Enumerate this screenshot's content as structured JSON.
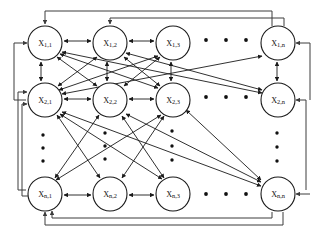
{
  "figure": {
    "kind": "neural-network-graph",
    "background_color": "#ffffff",
    "node_fill_color": "#ffffff",
    "node_stroke_color": "#1a1a1a",
    "edge_color": "#1a1a1a",
    "loop_edge_color": "#3c3c3c",
    "grid": {
      "row_index_labels": [
        "1",
        "2",
        "n"
      ],
      "column_index_labels": [
        "1",
        "2",
        "3",
        "n"
      ]
    },
    "nodes": [
      {
        "id": "x-1-1",
        "base": "X",
        "sub": "1,1",
        "label": "X1,1",
        "row": 1,
        "col": 1,
        "cx": 45,
        "cy": 43,
        "r": 17
      },
      {
        "id": "x-1-2",
        "base": "X",
        "sub": "1,2",
        "label": "X1,2",
        "row": 1,
        "col": 2,
        "cx": 110,
        "cy": 43,
        "r": 17
      },
      {
        "id": "x-1-3",
        "base": "X",
        "sub": "1,3",
        "label": "X1,3",
        "row": 1,
        "col": 3,
        "cx": 173,
        "cy": 43,
        "r": 17
      },
      {
        "id": "x-1-n",
        "base": "X",
        "sub": "1,n",
        "label": "X1,n",
        "row": 1,
        "col": 4,
        "cx": 278,
        "cy": 43,
        "r": 17
      },
      {
        "id": "x-2-1",
        "base": "X",
        "sub": "2,1",
        "label": "X2,1",
        "row": 2,
        "col": 1,
        "cx": 45,
        "cy": 100,
        "r": 17
      },
      {
        "id": "x-2-2",
        "base": "X",
        "sub": "2,2",
        "label": "X2,2",
        "row": 2,
        "col": 2,
        "cx": 110,
        "cy": 100,
        "r": 17
      },
      {
        "id": "x-2-3",
        "base": "X",
        "sub": "2,3",
        "label": "X2,3",
        "row": 2,
        "col": 3,
        "cx": 173,
        "cy": 100,
        "r": 17
      },
      {
        "id": "x-2-n",
        "base": "X",
        "sub": "2,n",
        "label": "X2,n",
        "row": 2,
        "col": 4,
        "cx": 278,
        "cy": 100,
        "r": 17
      },
      {
        "id": "x-n-1",
        "base": "X",
        "sub": "n,1",
        "label": "Xn,1",
        "row": 3,
        "col": 1,
        "cx": 45,
        "cy": 194,
        "r": 17
      },
      {
        "id": "x-n-2",
        "base": "X",
        "sub": "n,2",
        "label": "Xn,2",
        "row": 3,
        "col": 2,
        "cx": 110,
        "cy": 194,
        "r": 17
      },
      {
        "id": "x-n-3",
        "base": "X",
        "sub": "n,3",
        "label": "Xn,3",
        "row": 3,
        "col": 3,
        "cx": 173,
        "cy": 194,
        "r": 17
      },
      {
        "id": "x-n-n",
        "base": "X",
        "sub": "n,n",
        "label": "Xn,n",
        "row": 3,
        "col": 4,
        "cx": 278,
        "cy": 194,
        "r": 17
      }
    ],
    "horizontal_ellipses": [
      {
        "id": "ellipsis-row-1",
        "row": 1,
        "cy": 40,
        "xs": [
          206,
          226,
          246
        ]
      },
      {
        "id": "ellipsis-row-2",
        "row": 2,
        "cy": 97,
        "xs": [
          206,
          226,
          246
        ]
      },
      {
        "id": "ellipsis-row-n",
        "row": 3,
        "cy": 194,
        "xs": [
          206,
          226,
          246
        ]
      }
    ],
    "vertical_ellipses": [
      {
        "id": "ellipsis-col-1",
        "col": 1,
        "cx": 43,
        "ys": [
          135,
          148,
          161
        ]
      },
      {
        "id": "ellipsis-col-2",
        "col": 2,
        "cx": 105,
        "ys": [
          133,
          146,
          159
        ]
      },
      {
        "id": "ellipsis-col-3",
        "col": 3,
        "cx": 172,
        "ys": [
          131,
          146,
          160
        ]
      },
      {
        "id": "ellipsis-col-n",
        "col": 4,
        "cx": 277,
        "ys": [
          133,
          147,
          161
        ]
      }
    ]
  }
}
